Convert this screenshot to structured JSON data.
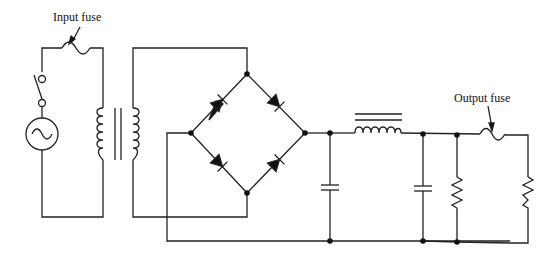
{
  "diagram": {
    "type": "circuit-schematic",
    "labels": {
      "input_fuse": "Input fuse",
      "output_fuse": "Output fuse"
    },
    "components": [
      {
        "id": "ac-source",
        "kind": "AC voltage source"
      },
      {
        "id": "switch",
        "kind": "SPST switch"
      },
      {
        "id": "input-fuse",
        "kind": "fuse"
      },
      {
        "id": "transformer",
        "kind": "iron-core transformer"
      },
      {
        "id": "bridge-rectifier",
        "kind": "full-wave diode bridge (4 diodes)"
      },
      {
        "id": "filter-cap-1",
        "kind": "capacitor"
      },
      {
        "id": "filter-choke",
        "kind": "iron-core inductor"
      },
      {
        "id": "filter-cap-2",
        "kind": "capacitor"
      },
      {
        "id": "bleeder-resistor",
        "kind": "resistor"
      },
      {
        "id": "output-fuse",
        "kind": "fuse"
      },
      {
        "id": "load-resistor",
        "kind": "resistor"
      }
    ],
    "colors": {
      "line": "#222222",
      "background": "#ffffff"
    }
  }
}
